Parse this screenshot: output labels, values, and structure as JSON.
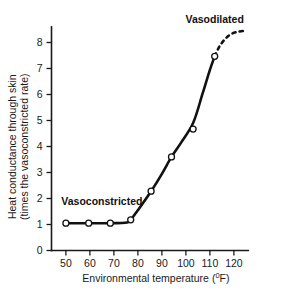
{
  "chart_data": {
    "type": "line",
    "title": "",
    "xlabel": "Environmental temperature (°F)",
    "ylabel": "Heat conductance through skin (times the vasoconstricted rate)",
    "ylabel_line1": "Heat conductance through skin",
    "ylabel_line2": "(times the vasoconstricted rate)",
    "xlabel_main": "Environmental temperature (",
    "xlabel_sup": "0",
    "xlabel_tail": "F)",
    "xlim": [
      44,
      126
    ],
    "ylim": [
      0,
      8.6
    ],
    "xticks": [
      50,
      60,
      70,
      80,
      90,
      100,
      110,
      120
    ],
    "yticks": [
      0,
      1,
      2,
      3,
      4,
      5,
      6,
      7,
      8
    ],
    "xticklabels": [
      "50",
      "60",
      "70",
      "80",
      "90",
      "100",
      "110",
      "120"
    ],
    "yticklabels": [
      "0",
      "1",
      "2",
      "3",
      "4",
      "5",
      "6",
      "7",
      "8"
    ],
    "grid": false,
    "legend": "none",
    "series": [
      {
        "name": "Heat conductance",
        "marker": "open-circle",
        "x": [
          50.0,
          59.5,
          68.5,
          77.0,
          85.5,
          94.0,
          103.0,
          112.0
        ],
        "y": [
          1.05,
          1.05,
          1.05,
          1.18,
          2.28,
          3.6,
          4.67,
          7.47
        ]
      }
    ],
    "curve_solid_points": [
      [
        50.0,
        1.05
      ],
      [
        59.5,
        1.05
      ],
      [
        68.5,
        1.05
      ],
      [
        75.5,
        1.08
      ],
      [
        77.0,
        1.18
      ],
      [
        80.0,
        1.55
      ],
      [
        85.5,
        2.28
      ],
      [
        90.0,
        2.95
      ],
      [
        94.0,
        3.6
      ],
      [
        98.0,
        4.15
      ],
      [
        103.0,
        4.9
      ],
      [
        107.0,
        6.05
      ],
      [
        110.0,
        6.95
      ],
      [
        112.0,
        7.47
      ]
    ],
    "curve_dashed_points": [
      [
        112.0,
        7.47
      ],
      [
        114.0,
        7.85
      ],
      [
        116.5,
        8.15
      ],
      [
        119.0,
        8.33
      ],
      [
        122.0,
        8.42
      ],
      [
        125.0,
        8.45
      ]
    ],
    "annotations": [
      {
        "name": "vasodilated-label",
        "text": "Vasodilated",
        "x": 112.0,
        "y": 8.75,
        "anchor": "middle"
      },
      {
        "name": "vasoconstricted-label",
        "text": "Vasoconstricted",
        "x": 65.0,
        "y": 1.75,
        "anchor": "middle"
      }
    ],
    "colors": {
      "curve": "#111111",
      "axis": "#1a1a1a",
      "marker_fill": "#ffffff",
      "background": "#ffffff"
    }
  }
}
